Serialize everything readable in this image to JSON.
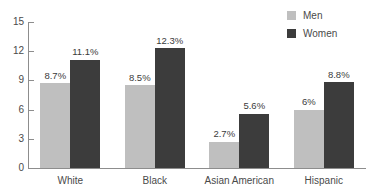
{
  "chart_data": {
    "type": "bar",
    "title": "",
    "xlabel": "",
    "ylabel": "",
    "categories": [
      "White",
      "Black",
      "Asian American",
      "Hispanic"
    ],
    "series": [
      {
        "name": "Men",
        "color": "#bfbfbf",
        "values": [
          8.7,
          8.5,
          2.7,
          6
        ],
        "labels": [
          "8.7%",
          "8.5%",
          "2.7%",
          "6%"
        ]
      },
      {
        "name": "Women",
        "color": "#3c3c3c",
        "values": [
          11.1,
          12.3,
          5.6,
          8.8
        ],
        "labels": [
          "11.1%",
          "12.3%",
          "5.6%",
          "8.8%"
        ]
      }
    ],
    "ylim": [
      0,
      15
    ],
    "yticks": [
      0,
      3,
      6,
      9,
      12,
      15
    ],
    "ytick_labels": [
      "0",
      "3",
      "6",
      "9",
      "12",
      "15"
    ],
    "grid": false,
    "legend_position": "top-right",
    "axis_color": "#8d8d8d",
    "text_color": "#4a4a4a",
    "background": "#ffffff"
  },
  "legend": {
    "entries": [
      {
        "label": "Men",
        "color": "#bfbfbf"
      },
      {
        "label": "Women",
        "color": "#3c3c3c"
      }
    ]
  }
}
